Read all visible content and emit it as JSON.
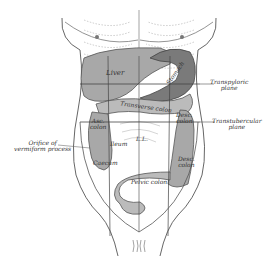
{
  "figure": {
    "labels": {
      "liver": "Liver",
      "stomach": "Stomach",
      "transverse_colon": "Transverse colon",
      "transpyloric_plane_1": "Transpyloric",
      "transpyloric_plane_2": "plane",
      "asc_colon_1": "Asc.",
      "asc_colon_2": "colon",
      "desc_colon_upper_1": "Desc.",
      "desc_colon_upper_2": "colon",
      "ileum": "Ileum",
      "ll": "L.L.",
      "transtubercular_plane_1": "Transtubercular",
      "transtubercular_plane_2": "plane",
      "orifice_1": "Orifice of",
      "orifice_2": "vermiform process",
      "caecum": "Caecum",
      "desc_colon_lower_1": "Desc.",
      "desc_colon_lower_2": "colon",
      "pelvic_colon": "Pelvic colon"
    },
    "colors": {
      "line": "#555555",
      "organ_fill": "#a8a8a8",
      "organ_dark": "#7a7a7a",
      "text": "#333333"
    }
  }
}
